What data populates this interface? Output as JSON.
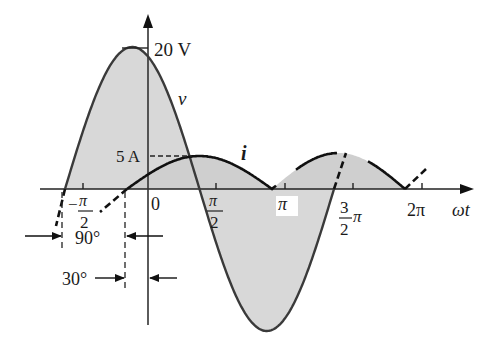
{
  "figure": {
    "type": "phasor-waveform",
    "colors": {
      "background": "#ffffff",
      "fill": "#d8d8d8",
      "v_curve": "#3a3a3a",
      "i_curve": "#111111",
      "axis": "#222222"
    }
  },
  "labels": {
    "v_peak": "20 V",
    "i_peak": "5 A",
    "v_name": "v",
    "i_name": "i",
    "x_axis": "ωt",
    "origin": "0",
    "neg_half_pi_sign": "−",
    "pi_sym": "π",
    "two": "2",
    "three": "3",
    "pi": "π",
    "two_pi": "2π",
    "angle_90": "90°",
    "angle_30": "30°"
  },
  "chart_data": {
    "type": "line",
    "title": "",
    "xlabel": "ωt",
    "ylabel": "",
    "x_ticks": [
      "−π/2",
      "0",
      "π/2",
      "π",
      "3/2π",
      "2π"
    ],
    "grid": false,
    "series": [
      {
        "name": "v",
        "amplitude": 20,
        "unit": "V",
        "phase_deg": 120,
        "expression": "v = 20 sin(ωt + 120°)",
        "shaded": true
      },
      {
        "name": "i",
        "amplitude": 5,
        "unit": "A",
        "phase_deg": 30,
        "expression": "i = 5 sin(ωt + 30°)",
        "shaded": true
      }
    ],
    "annotations": [
      {
        "text": "90°",
        "meaning": "phase difference between v and i (v leads i)"
      },
      {
        "text": "30°",
        "meaning": "phase angle of i relative to origin"
      },
      {
        "text": "20 V",
        "meaning": "peak of v"
      },
      {
        "text": "5 A",
        "meaning": "peak of i"
      }
    ]
  }
}
